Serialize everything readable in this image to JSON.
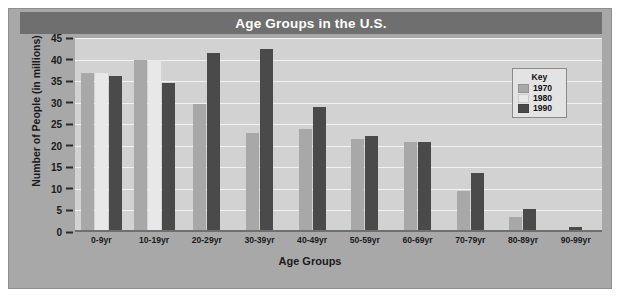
{
  "chart_data": {
    "type": "bar",
    "title": "Age Groups in the U.S.",
    "xlabel": "Age Groups",
    "ylabel": "Number of People (in millions)",
    "ylim": [
      0,
      45
    ],
    "yticks": [
      0,
      5,
      10,
      15,
      20,
      25,
      30,
      35,
      40,
      45
    ],
    "grid": true,
    "legend_title": "Key",
    "legend_position": "inside-top-right",
    "categories": [
      "0-9yr",
      "10-19yr",
      "20-29yr",
      "30-39yr",
      "40-49yr",
      "50-59yr",
      "60-69yr",
      "70-79yr",
      "80-89yr",
      "90-99yr"
    ],
    "series": [
      {
        "name": "1970",
        "color": "#a8a8a8",
        "values": [
          36.8,
          40.0,
          29.8,
          23.0,
          24.0,
          21.5,
          20.8,
          9.5,
          3.5,
          0.0
        ]
      },
      {
        "name": "1980",
        "color": "#e8e8e8",
        "values": [
          36.8,
          40.0,
          0.0,
          0.0,
          0.0,
          0.0,
          0.0,
          0.0,
          0.0,
          0.0
        ]
      },
      {
        "name": "1990",
        "color": "#4a4a4a",
        "values": [
          36.2,
          34.5,
          41.5,
          42.5,
          29.0,
          22.3,
          20.8,
          13.8,
          5.3,
          1.2
        ]
      }
    ]
  },
  "colors": {
    "title_bar": "#6f6f6f",
    "frame": "#a8a8a8",
    "plot_background": "#d2d2d2",
    "gridline": "#f2f2f2",
    "axis": "#6f6f6f",
    "text": "#1b1b1b"
  }
}
